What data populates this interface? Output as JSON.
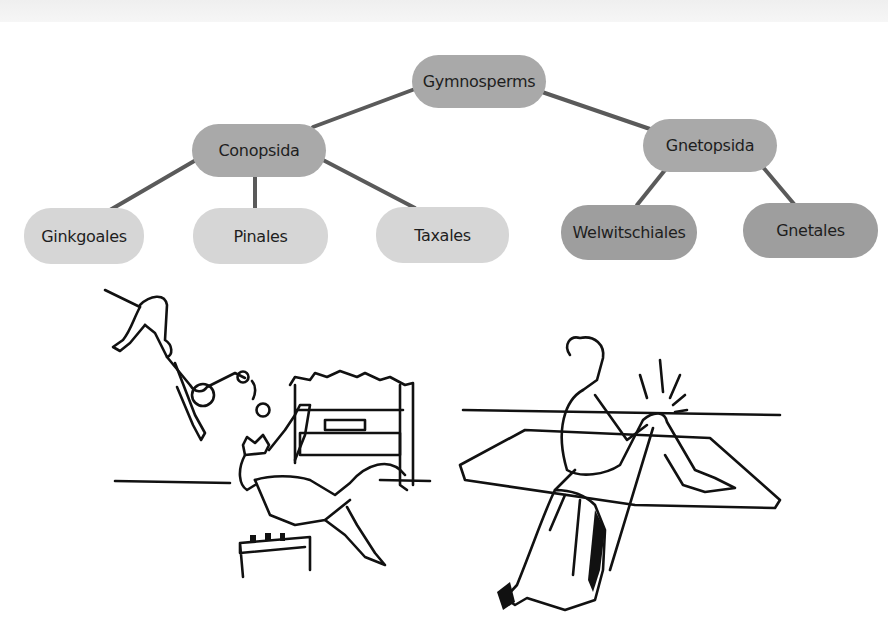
{
  "diagram": {
    "type": "hierarchy-tree",
    "root": {
      "label": "Gymnosperms",
      "children": [
        {
          "label": "Conopsida",
          "children": [
            {
              "label": "Ginkgoales"
            },
            {
              "label": "Pinales"
            },
            {
              "label": "Taxales"
            }
          ]
        },
        {
          "label": "Gnetopsida",
          "children": [
            {
              "label": "Welwitschiales"
            },
            {
              "label": "Gnetales"
            }
          ]
        }
      ]
    },
    "nodes": {
      "gymnosperms": "Gymnosperms",
      "conopsida": "Conopsida",
      "gnetopsida": "Gnetopsida",
      "ginkgoales": "Ginkgoales",
      "pinales": "Pinales",
      "taxales": "Taxales",
      "welwitschiales": "Welwitschiales",
      "gnetales": "Gnetales"
    },
    "colors": {
      "upper_nodes": "#a9a9a9",
      "conopsida_leaves": "#d6d6d6",
      "gnetopsida_leaves": "#9e9e9e",
      "connector": "#5a5a5a",
      "text": "#1e1e1e"
    }
  },
  "illustrations": [
    {
      "name": "acrobat-and-pianist-scene",
      "description": "Line drawing: an acrobat swinging upside down kicking a ball toward a crowned man falling back from a piano bench in front of an upright piano"
    },
    {
      "name": "injured-knee-scene",
      "description": "Line drawing: a seated person on a mat holding a knee with pain marks, a cloaked figure holding a staff in the foreground"
    }
  ]
}
